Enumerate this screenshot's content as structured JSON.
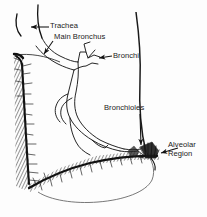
{
  "figure": {
    "background_color": "#fdfdfd",
    "ink_color": "#111111",
    "labels": {
      "trachea": "Trachea",
      "main_bronchus": "Main Bronchus",
      "bronchi": "Bronchi",
      "bronchioles": "Bronchioles",
      "alveolar_region_line1": "Alveolar",
      "alveolar_region_line2": "Region"
    },
    "structures": [
      {
        "name": "trachea",
        "description": "curved tube entering at upper left"
      },
      {
        "name": "main-bronchus",
        "description": "trunk branching from trachea into lung"
      },
      {
        "name": "bronchi",
        "description": "upper airway branches"
      },
      {
        "name": "bronchioles",
        "description": "fine lower airway branches"
      },
      {
        "name": "alveolar-region",
        "description": "feathered terminal clusters at lower right"
      },
      {
        "name": "lung-outline",
        "description": "sectioned lung silhouette"
      },
      {
        "name": "pleural-surface",
        "description": "hatched dark band along left and bottom edges"
      },
      {
        "name": "diaphragm",
        "description": "lower curved shaded boundary"
      }
    ],
    "leader_arrows": [
      {
        "name": "arrow-trachea",
        "points_to": "trachea",
        "direction": "left"
      },
      {
        "name": "arrow-main-bronchus",
        "points_to": "main-bronchus",
        "direction": "down-left"
      },
      {
        "name": "arrow-bronchi",
        "points_to": "bronchi",
        "direction": "left"
      },
      {
        "name": "arrow-bronchioles",
        "points_to": "bronchioles",
        "direction": "down"
      },
      {
        "name": "arrow-alveolar-region",
        "points_to": "alveolar-region",
        "direction": "left"
      }
    ]
  }
}
